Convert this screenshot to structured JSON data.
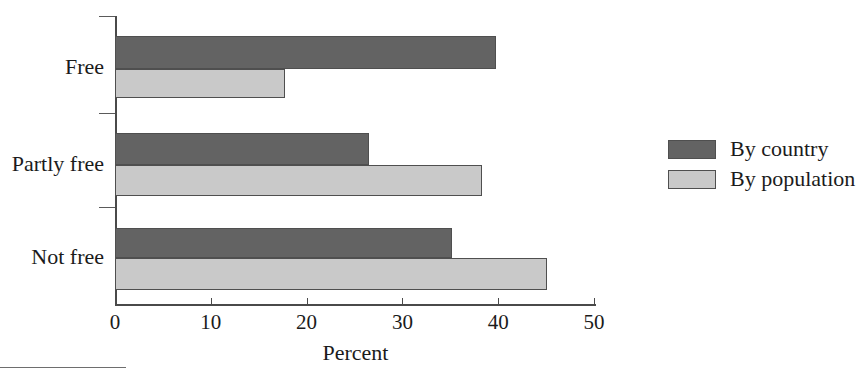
{
  "chart_data": {
    "type": "bar",
    "orientation": "horizontal",
    "title": "",
    "xlabel": "Percent",
    "ylabel": "",
    "categories": [
      "Free",
      "Partly free",
      "Not free"
    ],
    "series": [
      {
        "name": "By country",
        "color": "#636363",
        "values": [
          39.8,
          26.5,
          35.2
        ]
      },
      {
        "name": "By population",
        "color": "#c9c9c9",
        "values": [
          17.7,
          38.3,
          45.1
        ]
      }
    ],
    "xlim": [
      0,
      50
    ],
    "xticks": [
      0,
      10,
      20,
      30,
      40,
      50
    ],
    "xtick_labels": [
      "0",
      "10",
      "20",
      "30",
      "40",
      "50"
    ],
    "grid": false,
    "legend_position": "right"
  },
  "legend": {
    "items": [
      {
        "label": "By country",
        "color": "#636363"
      },
      {
        "label": "By population",
        "color": "#c9c9c9"
      }
    ]
  },
  "axis": {
    "x_title": "Percent"
  }
}
